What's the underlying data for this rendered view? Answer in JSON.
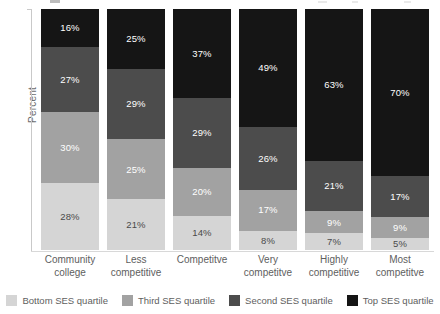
{
  "axes": {
    "y_title": "Percent"
  },
  "legend": {
    "items": [
      {
        "label": "Bottom SES quartile",
        "color": "#d5d5d5",
        "key": "bottom"
      },
      {
        "label": "Third SES quartile",
        "color": "#a2a2a2",
        "key": "third"
      },
      {
        "label": "Second SES quartile",
        "color": "#4c4c4c",
        "key": "second"
      },
      {
        "label": "Top SES quartile",
        "color": "#151515",
        "key": "top"
      }
    ]
  },
  "categories": [
    {
      "line1": "Community",
      "line2": "college"
    },
    {
      "line1": "Less",
      "line2": "competitive"
    },
    {
      "line1": "Competitve",
      "line2": ""
    },
    {
      "line1": "Very",
      "line2": "competitve"
    },
    {
      "line1": "Highly",
      "line2": "competitive"
    },
    {
      "line1": "Most",
      "line2": "competitve"
    }
  ],
  "bars": [
    {
      "category": "Community college",
      "segments": [
        {
          "key": "top",
          "label": "16%",
          "value": 16
        },
        {
          "key": "second",
          "label": "27%",
          "value": 27
        },
        {
          "key": "third",
          "label": "30%",
          "value": 30
        },
        {
          "key": "bottom",
          "label": "28%",
          "value": 28
        }
      ]
    },
    {
      "category": "Less competitive",
      "segments": [
        {
          "key": "top",
          "label": "25%",
          "value": 25
        },
        {
          "key": "second",
          "label": "29%",
          "value": 29
        },
        {
          "key": "third",
          "label": "25%",
          "value": 25
        },
        {
          "key": "bottom",
          "label": "21%",
          "value": 21
        }
      ]
    },
    {
      "category": "Competitve",
      "segments": [
        {
          "key": "top",
          "label": "37%",
          "value": 37
        },
        {
          "key": "second",
          "label": "29%",
          "value": 29
        },
        {
          "key": "third",
          "label": "20%",
          "value": 20
        },
        {
          "key": "bottom",
          "label": "14%",
          "value": 14
        }
      ]
    },
    {
      "category": "Very competitve",
      "segments": [
        {
          "key": "top",
          "label": "49%",
          "value": 49
        },
        {
          "key": "second",
          "label": "26%",
          "value": 26
        },
        {
          "key": "third",
          "label": "17%",
          "value": 17
        },
        {
          "key": "bottom",
          "label": "8%",
          "value": 8
        }
      ]
    },
    {
      "category": "Highly competitive",
      "segments": [
        {
          "key": "top",
          "label": "63%",
          "value": 63
        },
        {
          "key": "second",
          "label": "21%",
          "value": 21
        },
        {
          "key": "third",
          "label": "9%",
          "value": 9
        },
        {
          "key": "bottom",
          "label": "7%",
          "value": 7
        }
      ]
    },
    {
      "category": "Most competitve",
      "segments": [
        {
          "key": "top",
          "label": "70%",
          "value": 70
        },
        {
          "key": "second",
          "label": "17%",
          "value": 17
        },
        {
          "key": "third",
          "label": "9%",
          "value": 9
        },
        {
          "key": "bottom",
          "label": "5%",
          "value": 5
        }
      ]
    }
  ],
  "chart_data": {
    "type": "bar",
    "subtype": "stacked-100-percent",
    "orientation": "vertical",
    "title": "",
    "xlabel": "",
    "ylabel": "Percent",
    "ylim": [
      0,
      100
    ],
    "grid": false,
    "legend_position": "bottom",
    "categories": [
      "Community college",
      "Less competitive",
      "Competitve",
      "Very competitve",
      "Highly competitive",
      "Most competitve"
    ],
    "series": [
      {
        "name": "Bottom SES quartile",
        "color": "#d5d5d5",
        "values": [
          28,
          21,
          14,
          8,
          7,
          5
        ]
      },
      {
        "name": "Third SES quartile",
        "color": "#a2a2a2",
        "values": [
          30,
          25,
          20,
          17,
          9,
          9
        ]
      },
      {
        "name": "Second SES quartile",
        "color": "#4c4c4c",
        "values": [
          27,
          29,
          29,
          26,
          21,
          17
        ]
      },
      {
        "name": "Top SES quartile",
        "color": "#151515",
        "values": [
          16,
          25,
          37,
          49,
          63,
          70
        ]
      }
    ],
    "stack_order_bottom_to_top": [
      "Bottom SES quartile",
      "Third SES quartile",
      "Second SES quartile",
      "Top SES quartile"
    ],
    "data_labels": true,
    "data_label_unit": "%"
  }
}
